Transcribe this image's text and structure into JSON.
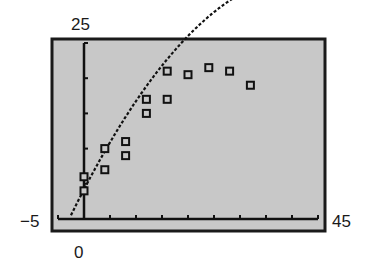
{
  "labels": {
    "ymax": "25",
    "xmin": "−5",
    "xmax": "45",
    "origin": "0"
  },
  "colors": {
    "screen": "#c8c8c8",
    "frame": "#1a1a1a",
    "ink": "#111111"
  },
  "chart_data": {
    "type": "scatter",
    "title": "",
    "xlabel": "",
    "ylabel": "",
    "xlim": [
      -5,
      45
    ],
    "ylim": [
      -2,
      25
    ],
    "x_ticks_every": 5,
    "y_ticks_every": 5,
    "grid": false,
    "window_labels": {
      "xmin": -5,
      "xmax": 45,
      "ymax": 25,
      "origin": 0
    },
    "series": [
      {
        "name": "data",
        "marker": "square",
        "points": [
          [
            0,
            4
          ],
          [
            0,
            6
          ],
          [
            4,
            7
          ],
          [
            4,
            10
          ],
          [
            8,
            9
          ],
          [
            8,
            11
          ],
          [
            12,
            15
          ],
          [
            12,
            17
          ],
          [
            16,
            17
          ],
          [
            16,
            21
          ],
          [
            20,
            20.5
          ],
          [
            24,
            21.5
          ],
          [
            28,
            21
          ],
          [
            32,
            19
          ]
        ]
      },
      {
        "name": "quadratic fit",
        "type": "line",
        "style": "dotted",
        "curve": "y = -0.0165x^2 + 1.42x + 4.2",
        "x_range": [
          -2.5,
          36
        ]
      }
    ]
  }
}
